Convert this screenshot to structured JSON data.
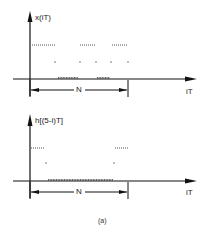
{
  "figure": {
    "caption": "(a)",
    "plots": [
      {
        "id": "top",
        "y_label": "x(iT)",
        "x_label": "iT",
        "span_label": "N",
        "axis_origin": [
          30,
          79
        ],
        "samples": {
          "high_segments": [
            [
              32,
              55
            ],
            [
              80,
              95
            ],
            [
              112,
              127
            ]
          ],
          "mid_points": [
            55,
            80,
            96,
            111,
            128
          ],
          "zero_segments": [
            [
              58,
              78
            ],
            [
              97,
              110
            ]
          ]
        }
      },
      {
        "id": "bottom",
        "y_label": "h[(5-i)T]",
        "x_label": "iT",
        "span_label": "N",
        "axis_origin": [
          30,
          181
        ],
        "samples": {
          "high_segments": [
            [
              31,
              45
            ],
            [
              115,
              128
            ]
          ],
          "mid_points": [
            46,
            114
          ],
          "zero_segments": [
            [
              48,
              113
            ]
          ]
        }
      }
    ]
  }
}
